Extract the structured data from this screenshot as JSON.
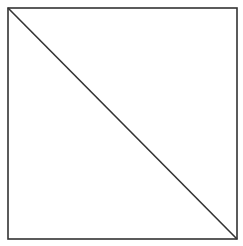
{
  "diagram": {
    "type": "geometric-figure",
    "shapes": [
      {
        "kind": "square",
        "x1": 8,
        "y1": 8,
        "x2": 237,
        "y2": 239
      },
      {
        "kind": "diagonal",
        "from": "top-left",
        "to": "bottom-right",
        "x1": 8,
        "y1": 8,
        "x2": 237,
        "y2": 239
      }
    ],
    "colors": {
      "background": "#ffffff",
      "stroke": "#333333"
    }
  }
}
